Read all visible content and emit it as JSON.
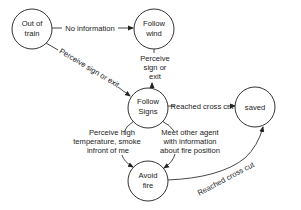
{
  "diagram": {
    "type": "state-transition",
    "nodes": [
      {
        "id": "out_of_train",
        "lines": [
          "Out of",
          "train"
        ]
      },
      {
        "id": "follow_wind",
        "lines": [
          "Follow",
          "wind"
        ]
      },
      {
        "id": "follow_signs",
        "lines": [
          "Follow",
          "Signs"
        ]
      },
      {
        "id": "saved",
        "lines": [
          "saved"
        ]
      },
      {
        "id": "avoid_fire",
        "lines": [
          "Avoid",
          "fire"
        ]
      }
    ],
    "edges": [
      {
        "from": "out_of_train",
        "to": "follow_wind",
        "lines": [
          "No information"
        ]
      },
      {
        "from": "out_of_train",
        "to": "follow_signs",
        "lines": [
          "Perceive sign or exit"
        ]
      },
      {
        "from": "follow_signs",
        "to": "follow_wind",
        "lines": [
          "Perceive",
          "sign or",
          "exit"
        ]
      },
      {
        "from": "follow_signs",
        "to": "saved",
        "lines": [
          "Reached cross cut"
        ]
      },
      {
        "from": "follow_signs",
        "to": "avoid_fire",
        "lines": [
          "Perceive high",
          "temperature, smoke",
          "infront of me"
        ]
      },
      {
        "from": "follow_signs",
        "to": "avoid_fire",
        "lines": [
          "Meet other agent",
          "with information",
          "about fire position"
        ]
      },
      {
        "from": "avoid_fire",
        "to": "saved",
        "lines": [
          "Reached cross cut"
        ]
      }
    ]
  }
}
